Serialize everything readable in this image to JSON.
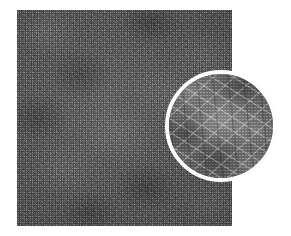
{
  "figure": {
    "kind": "micrograph",
    "modality": "scanning-electron-micrograph",
    "colorspace": "grayscale",
    "canvas": {
      "width": 291,
      "height": 236
    },
    "background_color": "#ffffff"
  },
  "main_panel": {
    "label": "",
    "alt_text": "Grayscale micrograph of a dense randomly oriented fibrous network",
    "bounds": {
      "x": 17,
      "y": 10,
      "width": 215,
      "height": 216
    },
    "tones": {
      "base_gray": "#6b6b6b",
      "fiber_highlight": "#c6c6c6",
      "interstice_shadow": "#2c2c2c"
    }
  },
  "inset_callout": {
    "label": "",
    "alt_text": "Circular magnified detail showing individual fibers and their junctions",
    "shape": "circle",
    "bounds": {
      "x": 165,
      "y": 70,
      "width": 112,
      "height": 112
    },
    "center": {
      "x": 221,
      "y": 126
    },
    "diameter": 112,
    "ring_color": "#fdfdfd",
    "ring_width": 4,
    "tones": {
      "base_gray": "#737373",
      "fiber_highlight": "#ebebeb",
      "interstice_shadow": "#1e1e1e"
    }
  },
  "annotations": {
    "scale_bar": "",
    "magnification": "",
    "caption": ""
  }
}
